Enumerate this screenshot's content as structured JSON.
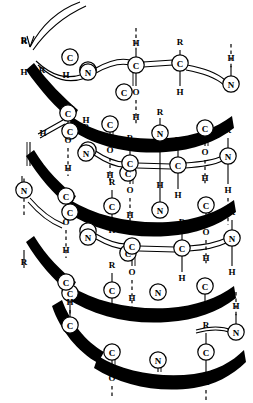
{
  "figure": {
    "type": "molecular-structure-diagram",
    "width": 253,
    "height": 403,
    "background_color": "#ffffff",
    "ink_color": "#000000"
  },
  "legend": {
    "atom_symbols": [
      "C",
      "N",
      "O",
      "H",
      "R"
    ],
    "bond_styles": {
      "front_ribbon": "thick solid black tapered band",
      "back_ribbon": "thin double line",
      "single_bond": "thin solid line",
      "double_bond": "thin parallel double line",
      "hydrogen_bond": "vertical dashed line"
    }
  },
  "atoms": [
    {
      "id": "a0",
      "label": "C",
      "x": 70,
      "y": 57,
      "circle": true
    },
    {
      "id": "a1",
      "label": "C",
      "x": 124,
      "y": 92,
      "circle": true
    },
    {
      "id": "a2",
      "label": "C",
      "x": 70,
      "y": 131,
      "circle": true
    },
    {
      "id": "a3",
      "label": "C",
      "x": 128,
      "y": 173,
      "circle": true
    },
    {
      "id": "a4",
      "label": "C",
      "x": 70,
      "y": 212,
      "circle": true
    },
    {
      "id": "a5",
      "label": "C",
      "x": 128,
      "y": 253,
      "circle": true
    },
    {
      "id": "a6",
      "label": "C",
      "x": 70,
      "y": 293,
      "circle": true
    },
    {
      "id": "n1",
      "label": "N",
      "x": 88,
      "y": 70,
      "circle": true
    },
    {
      "id": "n2",
      "label": "N",
      "x": 88,
      "y": 150,
      "circle": true
    },
    {
      "id": "n3",
      "label": "N",
      "x": 88,
      "y": 231,
      "circle": true
    },
    {
      "id": "n4",
      "label": "N",
      "x": 24,
      "y": 190,
      "circle": true
    },
    {
      "id": "r1",
      "label": "R",
      "x": 24,
      "y": 40,
      "circle": false
    },
    {
      "id": "h1",
      "label": "H",
      "x": 66,
      "y": 74,
      "circle": false
    },
    {
      "id": "f_n_t1",
      "label": "N",
      "x": 88,
      "y": 72,
      "circle": true
    },
    {
      "id": "f_c_t1",
      "label": "C",
      "x": 136,
      "y": 65,
      "circle": true
    },
    {
      "id": "f_c2_t1",
      "label": "C",
      "x": 180,
      "y": 63,
      "circle": true
    },
    {
      "id": "f_n2_t1",
      "label": "N",
      "x": 231,
      "y": 84,
      "circle": true
    },
    {
      "id": "fr_c_t1",
      "label": "C",
      "x": 68,
      "y": 113,
      "circle": true
    },
    {
      "id": "fr_c2_t1",
      "label": "C",
      "x": 110,
      "y": 124,
      "circle": true
    },
    {
      "id": "fr_n_t1",
      "label": "N",
      "x": 160,
      "y": 133,
      "circle": true
    },
    {
      "id": "fr_c3_t1",
      "label": "C",
      "x": 205,
      "y": 128,
      "circle": true
    },
    {
      "id": "b_n_t2",
      "label": "N",
      "x": 86,
      "y": 153,
      "circle": true
    },
    {
      "id": "b_c_t2",
      "label": "C",
      "x": 130,
      "y": 163,
      "circle": true
    },
    {
      "id": "b_c2_t2",
      "label": "C",
      "x": 178,
      "y": 165,
      "circle": true
    },
    {
      "id": "b_n2_t2",
      "label": "N",
      "x": 228,
      "y": 156,
      "circle": true
    },
    {
      "id": "m_c_t2",
      "label": "C",
      "x": 66,
      "y": 196,
      "circle": true
    },
    {
      "id": "m_c2_t2",
      "label": "C",
      "x": 112,
      "y": 206,
      "circle": true
    },
    {
      "id": "m_n_t2",
      "label": "N",
      "x": 160,
      "y": 210,
      "circle": true
    },
    {
      "id": "m_c3_t2",
      "label": "C",
      "x": 206,
      "y": 205,
      "circle": true
    },
    {
      "id": "l_n_t3",
      "label": "N",
      "x": 88,
      "y": 237,
      "circle": true
    },
    {
      "id": "l_c_t3",
      "label": "C",
      "x": 132,
      "y": 246,
      "circle": true
    },
    {
      "id": "l_c2_t3",
      "label": "C",
      "x": 182,
      "y": 248,
      "circle": true
    },
    {
      "id": "l_n2_t3",
      "label": "N",
      "x": 232,
      "y": 238,
      "circle": true
    },
    {
      "id": "z_c_t3",
      "label": "C",
      "x": 66,
      "y": 282,
      "circle": true
    },
    {
      "id": "z_c2_t3",
      "label": "C",
      "x": 112,
      "y": 290,
      "circle": true
    },
    {
      "id": "z_n_t3",
      "label": "N",
      "x": 158,
      "y": 292,
      "circle": true
    },
    {
      "id": "z_c3_t3",
      "label": "C",
      "x": 205,
      "y": 286,
      "circle": true
    },
    {
      "id": "bt_c",
      "label": "C",
      "x": 70,
      "y": 325,
      "circle": true
    },
    {
      "id": "bt_c2",
      "label": "C",
      "x": 112,
      "y": 352,
      "circle": true
    },
    {
      "id": "bt_n",
      "label": "N",
      "x": 158,
      "y": 360,
      "circle": true
    },
    {
      "id": "bt_c3",
      "label": "C",
      "x": 206,
      "y": 352,
      "circle": true
    },
    {
      "id": "bt_n2",
      "label": "N",
      "x": 236,
      "y": 332,
      "circle": true
    }
  ],
  "substituent_labels": [
    {
      "label": "R",
      "x": 24,
      "y": 40
    },
    {
      "label": "H",
      "x": 24,
      "y": 72
    },
    {
      "label": "R",
      "x": 42,
      "y": 70
    },
    {
      "label": "H",
      "x": 43,
      "y": 133
    },
    {
      "label": "R",
      "x": 180,
      "y": 42
    },
    {
      "label": "H",
      "x": 180,
      "y": 92
    },
    {
      "label": "H",
      "x": 136,
      "y": 43
    },
    {
      "label": "O",
      "x": 136,
      "y": 92
    },
    {
      "label": "H",
      "x": 136,
      "y": 117
    },
    {
      "label": "R",
      "x": 160,
      "y": 112
    },
    {
      "label": "H",
      "x": 231,
      "y": 58
    },
    {
      "label": "O",
      "x": 68,
      "y": 140
    },
    {
      "label": "H",
      "x": 68,
      "y": 168
    },
    {
      "label": "O",
      "x": 110,
      "y": 150
    },
    {
      "label": "H",
      "x": 110,
      "y": 175
    },
    {
      "label": "R",
      "x": 86,
      "y": 127
    },
    {
      "label": "H",
      "x": 86,
      "y": 120
    },
    {
      "label": "R",
      "x": 130,
      "y": 138
    },
    {
      "label": "H",
      "x": 160,
      "y": 185
    },
    {
      "label": "O",
      "x": 205,
      "y": 152
    },
    {
      "label": "H",
      "x": 205,
      "y": 178
    },
    {
      "label": "R",
      "x": 228,
      "y": 130
    },
    {
      "label": "H",
      "x": 228,
      "y": 190
    },
    {
      "label": "R",
      "x": 112,
      "y": 182
    },
    {
      "label": "H",
      "x": 112,
      "y": 230
    },
    {
      "label": "R",
      "x": 178,
      "y": 140
    },
    {
      "label": "H",
      "x": 178,
      "y": 195
    },
    {
      "label": "O",
      "x": 130,
      "y": 190
    },
    {
      "label": "H",
      "x": 130,
      "y": 215
    },
    {
      "label": "O",
      "x": 66,
      "y": 222
    },
    {
      "label": "H",
      "x": 66,
      "y": 250
    },
    {
      "label": "R",
      "x": 24,
      "y": 262
    },
    {
      "label": "R",
      "x": 112,
      "y": 265
    },
    {
      "label": "H",
      "x": 112,
      "y": 312
    },
    {
      "label": "O",
      "x": 132,
      "y": 272
    },
    {
      "label": "H",
      "x": 132,
      "y": 298
    },
    {
      "label": "O",
      "x": 206,
      "y": 232
    },
    {
      "label": "H",
      "x": 206,
      "y": 258
    },
    {
      "label": "R",
      "x": 182,
      "y": 222
    },
    {
      "label": "H",
      "x": 182,
      "y": 278
    },
    {
      "label": "R",
      "x": 232,
      "y": 212
    },
    {
      "label": "H",
      "x": 232,
      "y": 272
    },
    {
      "label": "H",
      "x": 70,
      "y": 302
    },
    {
      "label": "O",
      "x": 112,
      "y": 378
    },
    {
      "label": "R",
      "x": 206,
      "y": 325
    },
    {
      "label": "H",
      "x": 206,
      "y": 382
    },
    {
      "label": "O",
      "x": 158,
      "y": 378
    },
    {
      "label": "H",
      "x": 236,
      "y": 306
    }
  ],
  "hydrogen_bonds": [
    {
      "from_x": 136,
      "from_y": 28,
      "to_x": 136,
      "to_y": 50
    },
    {
      "from_x": 231,
      "from_y": 44,
      "to_x": 231,
      "to_y": 68
    },
    {
      "from_x": 136,
      "from_y": 100,
      "to_x": 136,
      "to_y": 126
    },
    {
      "from_x": 68,
      "from_y": 148,
      "to_x": 68,
      "to_y": 176
    },
    {
      "from_x": 110,
      "from_y": 158,
      "to_x": 110,
      "to_y": 184
    },
    {
      "from_x": 205,
      "from_y": 160,
      "to_x": 205,
      "to_y": 186
    },
    {
      "from_x": 228,
      "from_y": 198,
      "to_x": 228,
      "to_y": 225
    },
    {
      "from_x": 130,
      "from_y": 198,
      "to_x": 130,
      "to_y": 225
    },
    {
      "from_x": 66,
      "from_y": 230,
      "to_x": 66,
      "to_y": 258
    },
    {
      "from_x": 206,
      "from_y": 240,
      "to_x": 206,
      "to_y": 266
    },
    {
      "from_x": 132,
      "from_y": 280,
      "to_x": 132,
      "to_y": 308
    },
    {
      "from_x": 236,
      "from_y": 292,
      "to_x": 236,
      "to_y": 318
    },
    {
      "from_x": 112,
      "from_y": 386,
      "to_x": 112,
      "to_y": 398
    },
    {
      "from_x": 206,
      "from_y": 390,
      "to_x": 206,
      "to_y": 400
    },
    {
      "from_x": 24,
      "from_y": 215,
      "to_x": 24,
      "to_y": 176
    },
    {
      "from_x": 70,
      "from_y": 310,
      "to_x": 70,
      "to_y": 334
    }
  ]
}
